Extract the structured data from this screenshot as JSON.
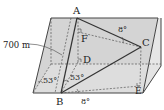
{
  "diagram": {
    "type": "3d-geometry-parallelepiped",
    "points": {
      "A": "A",
      "B": "B",
      "C": "C",
      "D": "D",
      "E": "E",
      "F": "F"
    },
    "annotations": {
      "height": "700 m",
      "angle_left_face": "53°",
      "angle_ABD": "53°",
      "angle_top": "8°",
      "angle_bottom": "8°"
    },
    "colors": {
      "face_fill": "#d9d9d9",
      "face_fill_light": "#e8e8e8",
      "line": "#333333"
    }
  }
}
